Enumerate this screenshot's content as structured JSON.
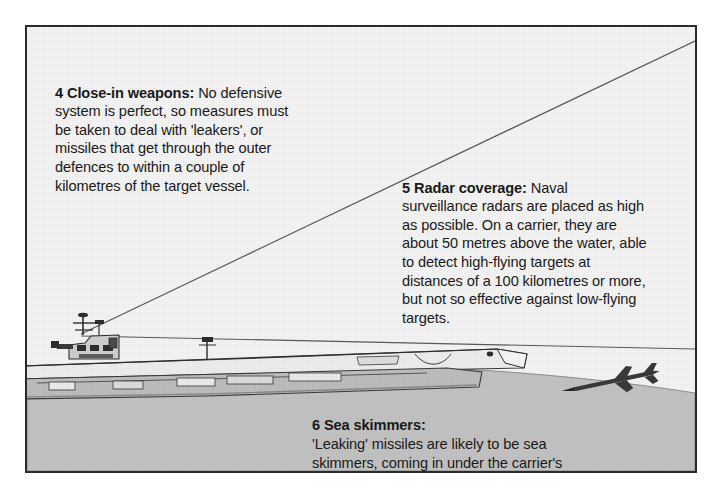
{
  "figure": {
    "title_visible": false,
    "frame": {
      "border_color": "#2b2b2b",
      "background": "#f6f6f6"
    }
  },
  "colors": {
    "sky": "#f4f4f4",
    "sea": "#c2c2c2",
    "ink": "#1a1a1a",
    "line": "#555555",
    "ship_hull": "#6e6e6e",
    "ship_light": "#ededed",
    "missile": "#3a3a3a"
  },
  "callouts": [
    {
      "id": "callout-4",
      "number": "4",
      "lead": "4  Close-in weapons:",
      "body": " No defensive system is perfect, so measures must be taken to deal with 'leakers', or missiles that get through the outer defences to within a couple of kilometres of the target vessel."
    },
    {
      "id": "callout-5",
      "number": "5",
      "lead": "5  Radar coverage:",
      "body": " Naval surveillance radars are placed as high as possible. On a carrier, they are about 50 metres above the water, able to detect high-flying targets at distances of a 100 kilometres or more, but not so effective against low-flying targets."
    },
    {
      "id": "callout-6",
      "number": "6",
      "lead": "6  Sea skimmers:",
      "body": "'Leaking' missiles are likely to be sea skimmers, coming in under the carrier's radar coverage."
    }
  ],
  "scene": {
    "carrier_label": "aircraft-carrier",
    "missile_label": "sea-skimming-missile",
    "radar_beam_upper_label": "radar-coverage-upper-limit",
    "radar_beam_lower_label": "radar-coverage-lower-limit",
    "sea_label": "sea-surface",
    "sky_label": "sky"
  }
}
